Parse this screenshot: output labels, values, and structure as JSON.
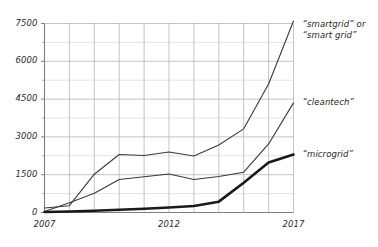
{
  "chart_data": {
    "type": "line",
    "title": "",
    "xlabel": "",
    "ylabel": "",
    "x": [
      2007,
      2008,
      2009,
      2010,
      2011,
      2012,
      2013,
      2014,
      2015,
      2016,
      2017
    ],
    "xlim": [
      2007,
      2017
    ],
    "ylim": [
      0,
      7500
    ],
    "grid": true,
    "y_major_ticks": [
      0,
      1500,
      3000,
      4500,
      6000,
      7500
    ],
    "y_minor_ticks": [
      750,
      2250,
      3750,
      5250,
      6750
    ],
    "x_tick_labels_shown": [
      "2007",
      "2012",
      "2017"
    ],
    "legend_position": "right-of-plot",
    "series": [
      {
        "name": "“smartgrid” or “smart grid”",
        "label_line1": "“smartgrid” or",
        "label_line2": "“smart grid”",
        "color": "#3a3a3a",
        "width": 1.1,
        "values": [
          180,
          270,
          1520,
          2300,
          2260,
          2400,
          2240,
          2680,
          3320,
          5100,
          7600
        ]
      },
      {
        "name": "“cleantech”",
        "label_line1": "“cleantech”",
        "color": "#3a3a3a",
        "width": 1.1,
        "values": [
          40,
          390,
          760,
          1310,
          1420,
          1530,
          1310,
          1430,
          1600,
          2720,
          4350
        ]
      },
      {
        "name": "“microgrid”",
        "label_line1": "“microgrid”",
        "color": "#1a1a1a",
        "width": 2.6,
        "values": [
          20,
          40,
          70,
          110,
          150,
          200,
          260,
          430,
          1180,
          1980,
          2300
        ]
      }
    ]
  },
  "axes": {
    "y_ticks": [
      {
        "value": 7500,
        "label": "7500"
      },
      {
        "value": 6000,
        "label": "6000"
      },
      {
        "value": 4500,
        "label": "4500"
      },
      {
        "value": 3000,
        "label": "3000"
      },
      {
        "value": 1500,
        "label": "1500"
      },
      {
        "value": 0,
        "label": "0"
      }
    ],
    "x_ticks": [
      {
        "value": 2007,
        "label": "2007"
      },
      {
        "value": 2012,
        "label": "2012"
      },
      {
        "value": 2017,
        "label": "2017"
      }
    ]
  },
  "colors": {
    "grid_major": "#b9b9b9",
    "grid_minor": "#d8d8d8",
    "axis": "#7f7f7f",
    "baseline": "#1a1a1a",
    "text": "#2b2b2b",
    "background": "#ffffff"
  }
}
